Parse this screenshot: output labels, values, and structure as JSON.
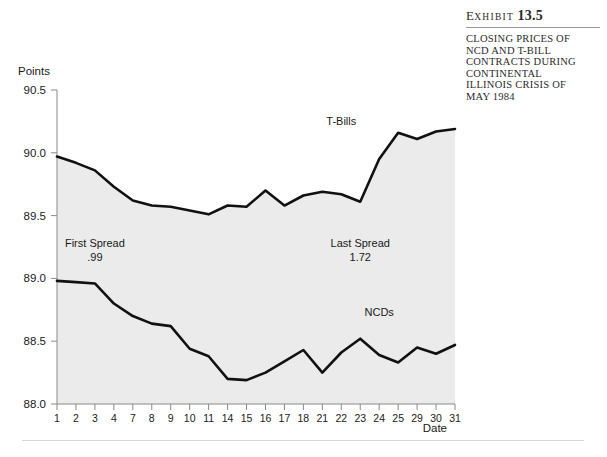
{
  "exhibit": {
    "label_prefix": "E",
    "label_rest": "XHIBIT",
    "number": "13.5",
    "caption_lines": [
      "CLOSING PRICES OF",
      "NCD AND T-BILL",
      "CONTRACTS DURING",
      "CONTINENTAL",
      "ILLINOIS CRISIS OF",
      "MAY 1984"
    ]
  },
  "chart_data": {
    "type": "line",
    "title": "",
    "xlabel": "Date",
    "ylabel": "Points",
    "ylim": [
      88.0,
      90.5
    ],
    "ytick_labels": [
      "88.0",
      "88.5",
      "89.0",
      "89.5",
      "90.0",
      "90.5"
    ],
    "ytick_values": [
      88.0,
      88.5,
      89.0,
      89.5,
      90.0,
      90.5
    ],
    "grid": false,
    "legend": "inline-labels",
    "categories": [
      "1",
      "2",
      "3",
      "4",
      "7",
      "8",
      "9",
      "10",
      "11",
      "14",
      "15",
      "16",
      "17",
      "18",
      "21",
      "22",
      "23",
      "24",
      "25",
      "29",
      "30",
      "31"
    ],
    "series": [
      {
        "name": "T-Bills",
        "color": "#111111",
        "values": [
          89.97,
          89.92,
          89.86,
          89.73,
          89.62,
          89.58,
          89.57,
          89.54,
          89.51,
          89.58,
          89.57,
          89.7,
          89.58,
          89.66,
          89.69,
          89.67,
          89.61,
          89.95,
          90.16,
          90.11,
          90.17,
          90.19
        ]
      },
      {
        "name": "NCDs",
        "color": "#111111",
        "values": [
          88.98,
          88.97,
          88.96,
          88.8,
          88.7,
          88.64,
          88.62,
          88.44,
          88.38,
          88.2,
          88.19,
          88.25,
          88.34,
          88.43,
          88.25,
          88.41,
          88.52,
          88.39,
          88.33,
          88.45,
          88.4,
          88.47
        ]
      }
    ],
    "annotations": [
      {
        "name": "first-spread",
        "title": "First Spread",
        "value": ".99",
        "x_category": "3",
        "y": 89.25
      },
      {
        "name": "last-spread",
        "title": "Last Spread",
        "value": "1.72",
        "x_category": "23",
        "y": 89.25
      }
    ],
    "series_labels": [
      {
        "name": "T-Bills",
        "x_category": "22",
        "y": 90.22
      },
      {
        "name": "NCDs",
        "x_category": "24",
        "y": 88.7
      }
    ]
  }
}
